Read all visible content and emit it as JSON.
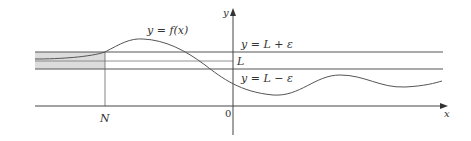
{
  "diagram": {
    "labels": {
      "curve": "y = f(x)",
      "upper_bound": "y = L + ε",
      "limit": "L",
      "lower_bound": "y = L − ε",
      "n_marker": "N",
      "origin": "0",
      "x_axis": "x",
      "y_axis": "y"
    },
    "colors": {
      "axis": "#333333",
      "lines": "#555555",
      "curve": "#555555",
      "shade": "#dcdcdc"
    }
  }
}
